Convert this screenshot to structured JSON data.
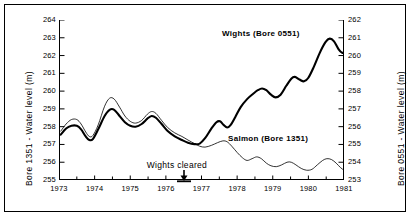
{
  "chart_data": {
    "type": "line",
    "title": "",
    "xlabel": "",
    "ylabel": "Bore 1351 - Water level (m)",
    "y2label": "Bore 0551 - Water level (m)",
    "grid": false,
    "legend": "inline-annotations",
    "xlim": [
      1973,
      1981
    ],
    "ylim": [
      255,
      264
    ],
    "y2lim": [
      253,
      262
    ],
    "x_ticks": [
      "1973",
      "1974",
      "1975",
      "1976",
      "1977",
      "1978",
      "1979",
      "1980",
      "1981"
    ],
    "y_ticks": [
      "255",
      "256",
      "257",
      "258",
      "259",
      "260",
      "261",
      "262",
      "263",
      "264"
    ],
    "y2_ticks": [
      "253",
      "254",
      "255",
      "256",
      "257",
      "258",
      "259",
      "260",
      "261",
      "262"
    ],
    "annotations": [
      {
        "text": "Wights cleared",
        "x": 1976.5,
        "marker": "down-arrow-with-bar"
      }
    ],
    "series": [
      {
        "name": "Wights (Bore 0551)",
        "axis": "right",
        "style": "thick",
        "label_text": "Wights (Bore 0551)",
        "points": [
          [
            1973.05,
            255.55
          ],
          [
            1973.2,
            255.9
          ],
          [
            1973.35,
            256.05
          ],
          [
            1973.5,
            256.05
          ],
          [
            1973.62,
            255.85
          ],
          [
            1973.75,
            255.45
          ],
          [
            1973.85,
            255.25
          ],
          [
            1973.95,
            255.3
          ],
          [
            1974.1,
            255.85
          ],
          [
            1974.28,
            256.6
          ],
          [
            1974.42,
            256.95
          ],
          [
            1974.55,
            256.95
          ],
          [
            1974.7,
            256.6
          ],
          [
            1974.85,
            256.25
          ],
          [
            1975.0,
            256.05
          ],
          [
            1975.15,
            256.0
          ],
          [
            1975.32,
            256.15
          ],
          [
            1975.48,
            256.45
          ],
          [
            1975.6,
            256.6
          ],
          [
            1975.72,
            256.5
          ],
          [
            1975.88,
            256.15
          ],
          [
            1976.05,
            255.75
          ],
          [
            1976.25,
            255.45
          ],
          [
            1976.45,
            255.25
          ],
          [
            1976.62,
            255.1
          ],
          [
            1976.8,
            255.02
          ],
          [
            1976.95,
            255.05
          ],
          [
            1977.1,
            255.35
          ],
          [
            1977.28,
            255.9
          ],
          [
            1977.42,
            256.25
          ],
          [
            1977.52,
            256.3
          ],
          [
            1977.62,
            256.1
          ],
          [
            1977.72,
            255.95
          ],
          [
            1977.82,
            256.1
          ],
          [
            1977.95,
            256.55
          ],
          [
            1978.1,
            257.1
          ],
          [
            1978.28,
            257.55
          ],
          [
            1978.45,
            257.85
          ],
          [
            1978.58,
            258.05
          ],
          [
            1978.7,
            258.15
          ],
          [
            1978.82,
            258.05
          ],
          [
            1978.95,
            257.8
          ],
          [
            1979.08,
            257.65
          ],
          [
            1979.22,
            257.8
          ],
          [
            1979.38,
            258.3
          ],
          [
            1979.52,
            258.7
          ],
          [
            1979.62,
            258.8
          ],
          [
            1979.75,
            258.65
          ],
          [
            1979.88,
            258.55
          ],
          [
            1980.0,
            258.75
          ],
          [
            1980.15,
            259.35
          ],
          [
            1980.32,
            260.15
          ],
          [
            1980.48,
            260.75
          ],
          [
            1980.6,
            260.95
          ],
          [
            1980.72,
            260.8
          ],
          [
            1980.85,
            260.35
          ],
          [
            1980.95,
            260.15
          ],
          [
            1981.0,
            260.2
          ]
        ]
      },
      {
        "name": "Salmon (Bore 1351)",
        "axis": "left",
        "style": "thin",
        "label_text": "Salmon (Bore 1351)",
        "points": [
          [
            1973.05,
            257.75
          ],
          [
            1973.2,
            258.15
          ],
          [
            1973.35,
            258.4
          ],
          [
            1973.5,
            258.4
          ],
          [
            1973.62,
            258.15
          ],
          [
            1973.75,
            257.7
          ],
          [
            1973.85,
            257.45
          ],
          [
            1973.95,
            257.5
          ],
          [
            1974.1,
            258.1
          ],
          [
            1974.28,
            259.15
          ],
          [
            1974.42,
            259.6
          ],
          [
            1974.55,
            259.55
          ],
          [
            1974.7,
            259.1
          ],
          [
            1974.85,
            258.6
          ],
          [
            1975.0,
            258.3
          ],
          [
            1975.15,
            258.2
          ],
          [
            1975.32,
            258.35
          ],
          [
            1975.48,
            258.7
          ],
          [
            1975.6,
            258.85
          ],
          [
            1975.72,
            258.75
          ],
          [
            1975.88,
            258.35
          ],
          [
            1976.05,
            257.95
          ],
          [
            1976.25,
            257.65
          ],
          [
            1976.45,
            257.45
          ],
          [
            1976.62,
            257.25
          ],
          [
            1976.8,
            257.05
          ],
          [
            1976.95,
            256.9
          ],
          [
            1977.1,
            256.85
          ],
          [
            1977.28,
            256.95
          ],
          [
            1977.45,
            257.1
          ],
          [
            1977.6,
            257.2
          ],
          [
            1977.72,
            257.15
          ],
          [
            1977.85,
            256.9
          ],
          [
            1978.0,
            256.55
          ],
          [
            1978.15,
            256.25
          ],
          [
            1978.28,
            256.1
          ],
          [
            1978.42,
            256.2
          ],
          [
            1978.55,
            256.3
          ],
          [
            1978.68,
            256.2
          ],
          [
            1978.82,
            255.95
          ],
          [
            1978.95,
            255.8
          ],
          [
            1979.1,
            255.75
          ],
          [
            1979.25,
            255.85
          ],
          [
            1979.4,
            256.0
          ],
          [
            1979.52,
            256.0
          ],
          [
            1979.65,
            255.85
          ],
          [
            1979.8,
            255.65
          ],
          [
            1979.95,
            255.55
          ],
          [
            1980.1,
            255.6
          ],
          [
            1980.25,
            255.85
          ],
          [
            1980.4,
            256.1
          ],
          [
            1980.52,
            256.2
          ],
          [
            1980.65,
            256.15
          ],
          [
            1980.78,
            255.95
          ],
          [
            1980.9,
            255.7
          ],
          [
            1981.0,
            255.55
          ]
        ]
      }
    ]
  },
  "axes": {
    "left_title": "Bore 1351 - Water level (m)",
    "right_title": "Bore 0551 - Water level (m)"
  },
  "labels": {
    "wights": "Wights (Bore 0551)",
    "salmon": "Salmon (Bore 1351)",
    "event": "Wights cleared"
  }
}
